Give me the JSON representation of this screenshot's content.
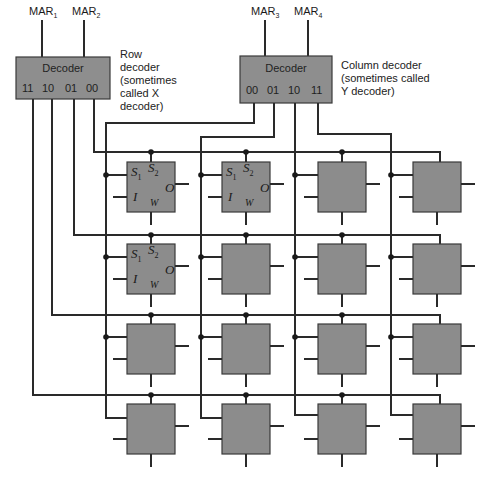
{
  "figure": {
    "row_decoder": {
      "inputs": [
        "MAR1",
        "MAR2"
      ],
      "input_labels": [
        {
          "base": "MAR",
          "sub": "1"
        },
        {
          "base": "MAR",
          "sub": "2"
        }
      ],
      "title": "Decoder",
      "outputs": [
        "11",
        "10",
        "01",
        "00"
      ],
      "caption_lines": [
        "Row",
        "decoder",
        "(sometimes",
        "called X",
        "decoder)"
      ],
      "caption_var": "X"
    },
    "column_decoder": {
      "inputs": [
        "MAR3",
        "MAR4"
      ],
      "input_labels": [
        {
          "base": "MAR",
          "sub": "3"
        },
        {
          "base": "MAR",
          "sub": "4"
        }
      ],
      "title": "Decoder",
      "outputs": [
        "00",
        "01",
        "10",
        "11"
      ],
      "caption_lines": [
        "Column decoder",
        "(sometimes called",
        "Y decoder)"
      ],
      "caption_var": "Y"
    },
    "cell_pins": {
      "s1": {
        "base": "S",
        "sub": "1"
      },
      "s2": {
        "base": "S",
        "sub": "2"
      },
      "input": "I",
      "output": "O",
      "write": "W"
    },
    "labeled_cells": [
      "r0c0",
      "r0c1",
      "r1c0"
    ],
    "grid": {
      "rows": 4,
      "cols": 4
    },
    "colors": {
      "decoder_fill": "#8e8e8e",
      "cell_fill": "#8c8c8c",
      "line": "#2a2a2a",
      "background": "#ffffff"
    }
  }
}
